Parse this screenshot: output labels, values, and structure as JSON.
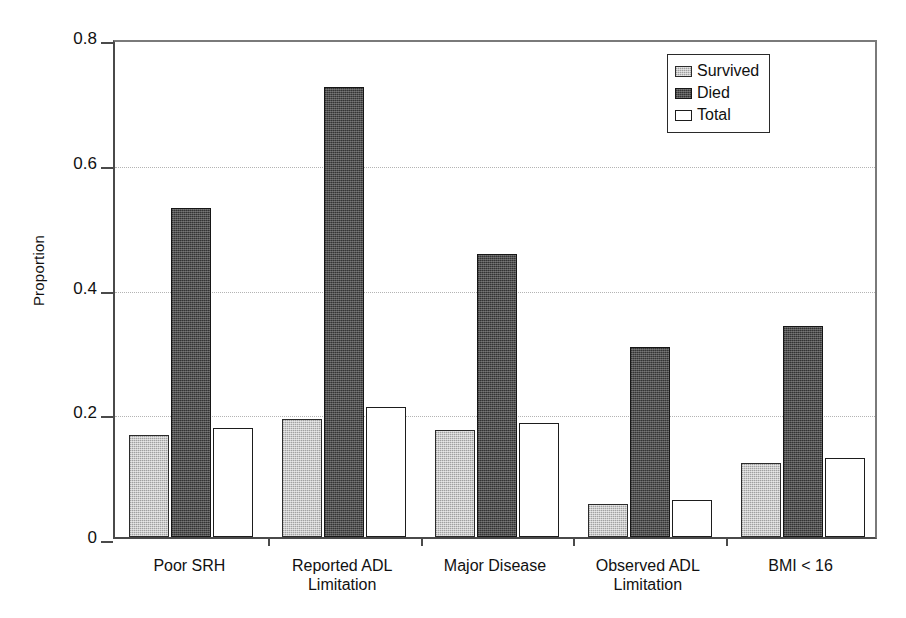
{
  "chart_data": {
    "type": "bar",
    "title": "",
    "xlabel": "",
    "ylabel": "Proportion",
    "ylim": [
      0,
      0.8
    ],
    "yticks": [
      "0",
      "0.2",
      "0.4",
      "0.6",
      "0.8"
    ],
    "ytick_values": [
      0,
      0.2,
      0.4,
      0.6,
      0.8
    ],
    "grid": "horizontal-dotted",
    "legend_position": "top-right",
    "categories": [
      "Poor SRH",
      "Reported ADL\nLimitation",
      "Major Disease",
      "Observed ADL\nLimitation",
      "BMI < 16"
    ],
    "category_lines": [
      [
        "Poor SRH"
      ],
      [
        "Reported ADL",
        "Limitation"
      ],
      [
        "Major Disease"
      ],
      [
        "Observed ADL",
        "Limitation"
      ],
      [
        "BMI < 16"
      ]
    ],
    "series": [
      {
        "name": "Survived",
        "color": "#c9c9c9",
        "values": [
          0.164,
          0.189,
          0.172,
          0.053,
          0.119
        ]
      },
      {
        "name": "Died",
        "color": "#4f4f4f",
        "values": [
          0.528,
          0.721,
          0.453,
          0.305,
          0.338
        ]
      },
      {
        "name": "Total",
        "color": "#ffffff",
        "values": [
          0.175,
          0.208,
          0.182,
          0.06,
          0.126
        ]
      }
    ]
  },
  "legend": {
    "items": [
      {
        "label": "Survived",
        "swatch": "survived"
      },
      {
        "label": "Died",
        "swatch": "died"
      },
      {
        "label": "Total",
        "swatch": "total"
      }
    ]
  },
  "colors": {
    "survived": "#c9c9c9",
    "died": "#4f4f4f",
    "total": "#ffffff",
    "axis": "#4a4a4a",
    "grid": "#b4b4b4",
    "text": "#111111"
  }
}
